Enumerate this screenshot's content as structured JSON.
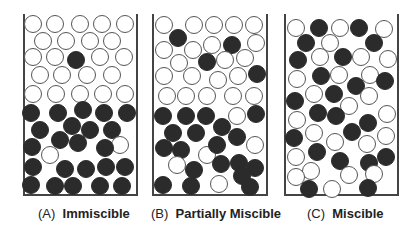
{
  "panels": [
    {
      "id": "A",
      "letter": "(A)",
      "title": "Immiscible",
      "box": [
        23,
        14,
        115,
        182
      ],
      "label_x": 38,
      "circles": [
        [
          33,
          24,
          0
        ],
        [
          55,
          24,
          0
        ],
        [
          80,
          24,
          0
        ],
        [
          102,
          24,
          0
        ],
        [
          125,
          24,
          0
        ],
        [
          43,
          41,
          0
        ],
        [
          66,
          41,
          0
        ],
        [
          90,
          41,
          0
        ],
        [
          112,
          41,
          0
        ],
        [
          33,
          57,
          0
        ],
        [
          55,
          57,
          0
        ],
        [
          76,
          60,
          1
        ],
        [
          100,
          57,
          0
        ],
        [
          124,
          57,
          0
        ],
        [
          40,
          75,
          0
        ],
        [
          62,
          75,
          0
        ],
        [
          87,
          75,
          0
        ],
        [
          112,
          75,
          0
        ],
        [
          33,
          94,
          0
        ],
        [
          56,
          94,
          0
        ],
        [
          80,
          94,
          0
        ],
        [
          103,
          94,
          0
        ],
        [
          125,
          94,
          0
        ],
        [
          31,
          113,
          1
        ],
        [
          58,
          113,
          1
        ],
        [
          83,
          110,
          1
        ],
        [
          104,
          113,
          1
        ],
        [
          127,
          113,
          1
        ],
        [
          40,
          130,
          1
        ],
        [
          72,
          126,
          1
        ],
        [
          90,
          130,
          1
        ],
        [
          112,
          130,
          1
        ],
        [
          32,
          147,
          1
        ],
        [
          60,
          140,
          1
        ],
        [
          78,
          143,
          1
        ],
        [
          120,
          145,
          0
        ],
        [
          50,
          155,
          0
        ],
        [
          105,
          148,
          1
        ],
        [
          33,
          167,
          1
        ],
        [
          65,
          169,
          1
        ],
        [
          86,
          169,
          1
        ],
        [
          106,
          167,
          1
        ],
        [
          125,
          167,
          1
        ],
        [
          31,
          185,
          1
        ],
        [
          55,
          186,
          1
        ],
        [
          73,
          186,
          1
        ],
        [
          100,
          186,
          1
        ],
        [
          122,
          186,
          1
        ]
      ]
    },
    {
      "id": "B",
      "letter": "(B)",
      "title": "Partially Miscible",
      "box": [
        152,
        14,
        116,
        182
      ],
      "label_x": 151,
      "circles": [
        [
          164,
          25,
          0
        ],
        [
          194,
          25,
          0
        ],
        [
          214,
          25,
          0
        ],
        [
          234,
          25,
          0
        ],
        [
          254,
          25,
          0
        ],
        [
          178,
          38,
          1
        ],
        [
          212,
          45,
          0
        ],
        [
          232,
          45,
          1
        ],
        [
          256,
          43,
          0
        ],
        [
          164,
          50,
          0
        ],
        [
          193,
          50,
          0
        ],
        [
          179,
          63,
          0
        ],
        [
          207,
          62,
          1
        ],
        [
          225,
          60,
          0
        ],
        [
          245,
          58,
          0
        ],
        [
          164,
          76,
          0
        ],
        [
          192,
          76,
          0
        ],
        [
          218,
          80,
          0
        ],
        [
          238,
          76,
          0
        ],
        [
          257,
          74,
          1
        ],
        [
          167,
          96,
          0
        ],
        [
          186,
          96,
          0
        ],
        [
          207,
          96,
          0
        ],
        [
          233,
          96,
          0
        ],
        [
          254,
          96,
          0
        ],
        [
          163,
          116,
          1
        ],
        [
          186,
          116,
          1
        ],
        [
          206,
          116,
          1
        ],
        [
          237,
          116,
          0
        ],
        [
          256,
          114,
          1
        ],
        [
          173,
          133,
          1
        ],
        [
          196,
          133,
          1
        ],
        [
          222,
          127,
          1
        ],
        [
          237,
          137,
          1
        ],
        [
          164,
          148,
          1
        ],
        [
          181,
          150,
          1
        ],
        [
          207,
          155,
          0
        ],
        [
          217,
          145,
          1
        ],
        [
          255,
          145,
          0
        ],
        [
          177,
          165,
          0
        ],
        [
          194,
          170,
          1
        ],
        [
          221,
          164,
          1
        ],
        [
          239,
          163,
          1
        ],
        [
          255,
          168,
          1
        ],
        [
          163,
          185,
          1
        ],
        [
          191,
          186,
          1
        ],
        [
          219,
          184,
          0
        ],
        [
          250,
          187,
          1
        ],
        [
          242,
          176,
          1
        ]
      ]
    },
    {
      "id": "C",
      "letter": "(C)",
      "title": "Miscible",
      "box": [
        284,
        14,
        115,
        182
      ],
      "label_x": 307,
      "circles": [
        [
          296,
          28,
          0
        ],
        [
          319,
          28,
          1
        ],
        [
          340,
          28,
          0
        ],
        [
          359,
          28,
          1
        ],
        [
          384,
          29,
          0
        ],
        [
          306,
          43,
          1
        ],
        [
          330,
          43,
          0
        ],
        [
          374,
          43,
          1
        ],
        [
          298,
          60,
          1
        ],
        [
          320,
          57,
          0
        ],
        [
          343,
          57,
          1
        ],
        [
          361,
          57,
          0
        ],
        [
          388,
          59,
          0
        ],
        [
          297,
          79,
          0
        ],
        [
          321,
          76,
          1
        ],
        [
          339,
          75,
          0
        ],
        [
          370,
          75,
          0
        ],
        [
          385,
          81,
          1
        ],
        [
          356,
          86,
          1
        ],
        [
          314,
          94,
          0
        ],
        [
          334,
          94,
          1
        ],
        [
          369,
          96,
          0
        ],
        [
          295,
          101,
          1
        ],
        [
          349,
          106,
          0
        ],
        [
          318,
          113,
          1
        ],
        [
          336,
          116,
          1
        ],
        [
          387,
          114,
          0
        ],
        [
          297,
          120,
          0
        ],
        [
          368,
          123,
          1
        ],
        [
          294,
          138,
          1
        ],
        [
          314,
          133,
          0
        ],
        [
          352,
          132,
          1
        ],
        [
          386,
          136,
          0
        ],
        [
          335,
          142,
          0
        ],
        [
          367,
          144,
          0
        ],
        [
          296,
          157,
          0
        ],
        [
          317,
          152,
          1
        ],
        [
          340,
          161,
          1
        ],
        [
          369,
          163,
          1
        ],
        [
          386,
          157,
          1
        ],
        [
          311,
          171,
          0
        ],
        [
          349,
          175,
          0
        ],
        [
          374,
          174,
          0
        ],
        [
          296,
          177,
          0
        ],
        [
          309,
          189,
          1
        ],
        [
          332,
          189,
          0
        ],
        [
          368,
          188,
          1
        ]
      ]
    }
  ]
}
